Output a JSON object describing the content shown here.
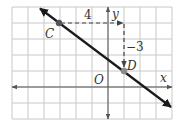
{
  "figure": {
    "grid": {
      "x0": 12,
      "y0": 7,
      "cols": 10,
      "rows": 7,
      "spacing": 16,
      "color": "#c8c8c8",
      "border_color": "#bdbdbd"
    },
    "axes": {
      "origin_px": [
        108,
        87
      ],
      "x_label": "x",
      "y_label": "y",
      "origin_label": "O",
      "color": "#555555"
    },
    "line": {
      "color": "#1a1a1a",
      "slope": "-3/4",
      "from_px": [
        38,
        7
      ],
      "to_px": [
        172,
        108
      ]
    },
    "points": [
      {
        "label": "C",
        "coords": [
          -3,
          4
        ],
        "px": [
          59,
          23
        ],
        "color": "#666666"
      },
      {
        "label": "D",
        "coords": [
          1,
          1
        ],
        "px": [
          124,
          71
        ],
        "color": "#8a8a8a"
      }
    ],
    "run": {
      "label": "4",
      "value": 4
    },
    "rise": {
      "label": "−3",
      "value": -3
    },
    "dash_color": "#444444"
  }
}
